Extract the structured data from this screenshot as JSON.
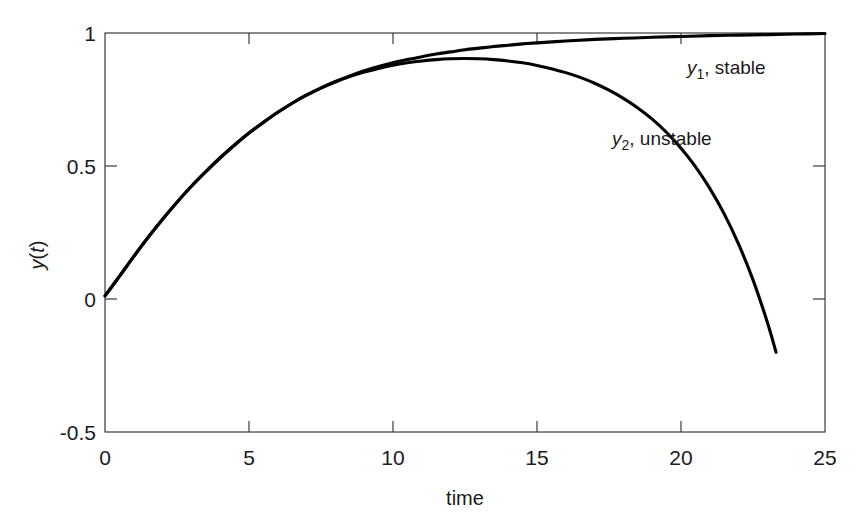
{
  "chart_data": {
    "type": "line",
    "title": "",
    "xlabel": "time",
    "ylabel": "y(t)",
    "xlim": [
      0,
      25
    ],
    "ylim": [
      -0.5,
      1
    ],
    "grid": false,
    "legend_position": "inline-annotations",
    "xticks": [
      0,
      5,
      10,
      15,
      20,
      25
    ],
    "xtick_labels": [
      "0",
      "5",
      "10",
      "15",
      "20",
      "25"
    ],
    "yticks": [
      -0.5,
      0,
      0.5,
      1
    ],
    "ytick_labels": [
      "-0.5",
      "0",
      "0.5",
      "1"
    ],
    "annotations": [
      {
        "name": "y1-label",
        "text_main": "y",
        "text_sub": "1",
        "text_rest": ", stable",
        "x": 20.2,
        "y": 0.86
      },
      {
        "name": "y2-label",
        "text_main": "y",
        "text_sub": "2",
        "text_rest": ",  unstable",
        "x": 17.6,
        "y": 0.54
      }
    ],
    "series": [
      {
        "name": "y1, stable",
        "color": "#000000",
        "x": [
          0,
          0.5,
          1,
          1.5,
          2,
          2.5,
          3,
          3.5,
          4,
          4.5,
          5,
          5.5,
          6,
          6.5,
          7,
          7.5,
          8,
          8.5,
          9,
          9.5,
          10,
          10.5,
          11,
          11.5,
          12,
          12.5,
          13,
          13.5,
          14,
          14.5,
          15,
          16,
          17,
          18,
          19,
          20,
          21,
          22,
          23,
          24,
          25
        ],
        "values": [
          0.012,
          0.085,
          0.16,
          0.232,
          0.3,
          0.364,
          0.424,
          0.479,
          0.531,
          0.579,
          0.624,
          0.664,
          0.702,
          0.736,
          0.767,
          0.794,
          0.818,
          0.839,
          0.858,
          0.874,
          0.888,
          0.9,
          0.911,
          0.921,
          0.929,
          0.937,
          0.943,
          0.949,
          0.954,
          0.959,
          0.963,
          0.97,
          0.976,
          0.98,
          0.984,
          0.987,
          0.99,
          0.992,
          0.994,
          0.996,
          0.998
        ]
      },
      {
        "name": "y2, unstable",
        "color": "#000000",
        "x": [
          0,
          0.5,
          1,
          1.5,
          2,
          2.5,
          3,
          3.5,
          4,
          4.5,
          5,
          5.5,
          6,
          6.5,
          7,
          7.5,
          8,
          8.5,
          9,
          9.5,
          10,
          10.5,
          11,
          11.5,
          12,
          12.5,
          13,
          13.5,
          14,
          14.5,
          15,
          15.5,
          16,
          16.5,
          17,
          17.5,
          18,
          18.5,
          19,
          19.5,
          20,
          20.5,
          21,
          21.5,
          22,
          22.5,
          23,
          23.3
        ],
        "values": [
          0.012,
          0.085,
          0.16,
          0.232,
          0.3,
          0.364,
          0.424,
          0.479,
          0.531,
          0.579,
          0.624,
          0.664,
          0.702,
          0.736,
          0.766,
          0.793,
          0.816,
          0.836,
          0.853,
          0.867,
          0.879,
          0.888,
          0.895,
          0.9,
          0.903,
          0.904,
          0.903,
          0.9,
          0.895,
          0.888,
          0.878,
          0.866,
          0.851,
          0.833,
          0.811,
          0.785,
          0.754,
          0.718,
          0.676,
          0.626,
          0.567,
          0.498,
          0.416,
          0.32,
          0.206,
          0.072,
          -0.088,
          -0.2
        ]
      }
    ]
  },
  "axis": {
    "ytick_1": "1",
    "ytick_05": "0.5",
    "ytick_0": "0",
    "ytick_m05": "-0.5",
    "xtick_0": "0",
    "xtick_5": "5",
    "xtick_10": "10",
    "xtick_15": "15",
    "xtick_20": "20",
    "xtick_25": "25",
    "xlabel": "time",
    "ylabel": "y(t)"
  },
  "labels": {
    "y1_var": "y",
    "y1_sub": "1",
    "y1_rest": ", stable",
    "y2_var": "y",
    "y2_sub": "2",
    "y2_rest": ",  unstable"
  }
}
